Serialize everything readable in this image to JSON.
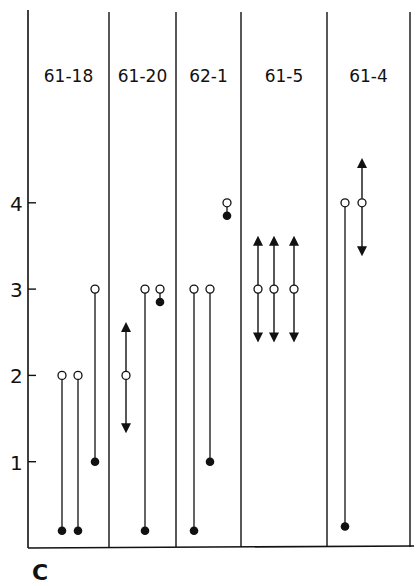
{
  "panel_label": "C",
  "chart_data": {
    "type": "scatter",
    "title": "",
    "xlabel": "",
    "ylabel": "",
    "yticks": [
      "1",
      "2",
      "3",
      "4"
    ],
    "ylim": [
      0,
      4.9
    ],
    "grid": false,
    "legend": null,
    "legend_symbols": {
      "open_circle": "upper value",
      "filled_circle": "lower value",
      "arrows": "range extends both directions"
    },
    "categories": [
      "61-18",
      "61-20",
      "62-1",
      "61-5",
      "61-4"
    ],
    "groups": [
      {
        "name": "61-18",
        "items": [
          {
            "open": 2.0,
            "filled": 0.2,
            "type": "line"
          },
          {
            "open": 2.0,
            "filled": 0.2,
            "type": "line"
          },
          {
            "open": 3.0,
            "filled": 1.0,
            "type": "line"
          }
        ]
      },
      {
        "name": "61-20",
        "items": [
          {
            "open": 2.0,
            "up": 2.55,
            "down": 1.4,
            "type": "arrow"
          },
          {
            "open": 3.0,
            "filled": 0.2,
            "type": "line"
          },
          {
            "open": 3.0,
            "filled": 2.85,
            "type": "line"
          }
        ]
      },
      {
        "name": "62-1",
        "items": [
          {
            "open": 3.0,
            "filled": 0.2,
            "type": "line"
          },
          {
            "open": 3.0,
            "filled": 1.0,
            "type": "line"
          },
          {
            "open": 4.0,
            "filled": 3.85,
            "type": "line"
          }
        ]
      },
      {
        "name": "61-5",
        "items": [
          {
            "open": 3.0,
            "up": 3.55,
            "down": 2.45,
            "type": "arrow"
          },
          {
            "open": 3.0,
            "up": 3.55,
            "down": 2.45,
            "type": "arrow"
          },
          {
            "open": 3.0,
            "up": 3.55,
            "down": 2.45,
            "type": "arrow"
          }
        ]
      },
      {
        "name": "61-4",
        "items": [
          {
            "open": 4.0,
            "filled": 0.25,
            "type": "line"
          },
          {
            "open": 4.0,
            "up": 4.45,
            "down": 3.45,
            "type": "arrow"
          }
        ]
      }
    ]
  }
}
